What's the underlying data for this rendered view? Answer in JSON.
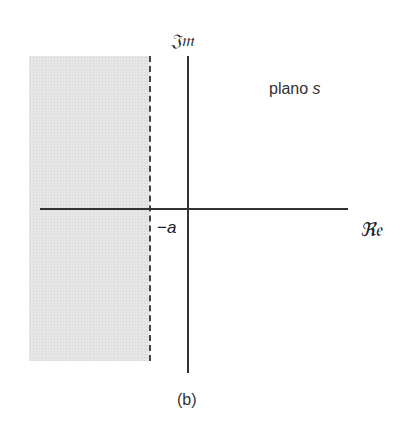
{
  "diagram": {
    "title": "",
    "caption": "(b)",
    "plane_label": {
      "text": "plano",
      "variable": "s"
    },
    "axes": {
      "imaginary_label": "𝔍𝔪",
      "real_label": "ℜ𝔢"
    },
    "marker": {
      "sign": "−",
      "variable": "a"
    },
    "regions": [
      {
        "name": "shaded-left-half-plane",
        "bound": "Re(s) < -a",
        "fill": "#e4e4e4"
      }
    ],
    "lines": [
      {
        "name": "dashed-boundary",
        "position": "Re(s) = -a",
        "style": "dashed"
      }
    ],
    "colors": {
      "axis": "#333333",
      "shade": "#e4e4e4",
      "text": "#222222"
    }
  }
}
